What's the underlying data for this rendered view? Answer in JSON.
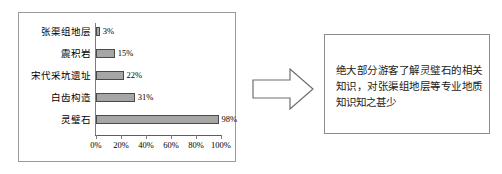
{
  "chart_data": {
    "type": "bar",
    "orientation": "horizontal",
    "title": "",
    "xlabel": "",
    "ylabel": "",
    "categories": [
      "灵璧石",
      "白齿构造",
      "宋代采坑遗址",
      "震积岩",
      "张渠组地层"
    ],
    "values": [
      98,
      31,
      22,
      15,
      3
    ],
    "value_labels": [
      "98%",
      "31%",
      "22%",
      "15%",
      "3%"
    ],
    "xlim": [
      0,
      100
    ],
    "xticks": [
      0,
      20,
      40,
      60,
      80,
      100
    ],
    "xtick_labels": [
      "0%",
      "20%",
      "40%",
      "60%",
      "80%",
      "100%"
    ],
    "grid": false,
    "legend": null,
    "bar_fill": "#a6a6a6",
    "bar_border": "#4a4a4a"
  },
  "callout": {
    "text": "绝大部分游客了解灵璧石的相关知识，对张渠组地层等专业地质知识知之甚少"
  },
  "arrow": {
    "direction": "right",
    "name": "right-arrow"
  }
}
